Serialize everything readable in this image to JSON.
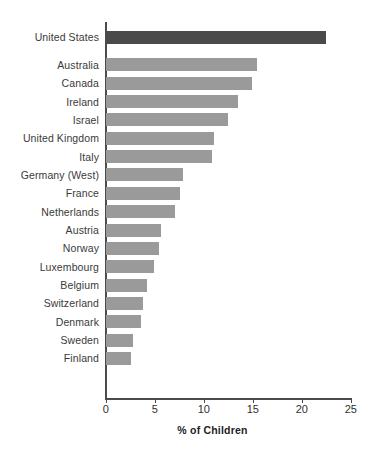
{
  "chart_data": {
    "type": "bar",
    "orientation": "horizontal",
    "title": "",
    "subtitle": "",
    "xlabel": "% of Children",
    "ylabel": "",
    "xlim": [
      0,
      25
    ],
    "xticks": [
      0,
      5,
      10,
      15,
      20,
      25
    ],
    "xtick_labels": [
      "0",
      "5",
      "10",
      "15",
      "20",
      "25"
    ],
    "grid": false,
    "legend": false,
    "categories": [
      "United States",
      "Australia",
      "Canada",
      "Ireland",
      "Israel",
      "United Kingdom",
      "Italy",
      "Germany (West)",
      "France",
      "Netherlands",
      "Austria",
      "Norway",
      "Luxembourg",
      "Belgium",
      "Switzerland",
      "Denmark",
      "Sweden",
      "Finland"
    ],
    "values": [
      22.4,
      15.4,
      14.9,
      13.5,
      12.4,
      11.0,
      10.8,
      7.9,
      7.6,
      7.0,
      5.6,
      5.4,
      4.9,
      4.2,
      3.8,
      3.6,
      2.8,
      2.5
    ],
    "highlight_category": "United States",
    "colors": {
      "bar": "#9a9a9a",
      "highlight_bar": "#4a4a4a",
      "axis": "#4b4b4b",
      "text": "#2f2f2f",
      "background": "#ffffff"
    }
  }
}
